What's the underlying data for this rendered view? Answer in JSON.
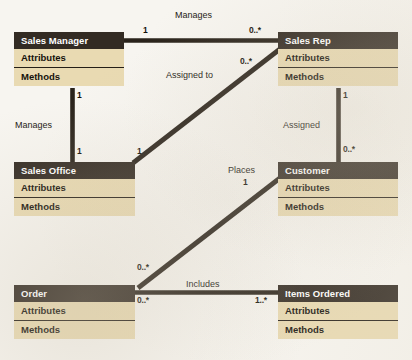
{
  "diagram": {
    "type": "uml-class-diagram",
    "colors": {
      "header_fill": "#332b23",
      "body_fill": "#e9dab2",
      "line": "#2a231b",
      "background": "#f7f5f0",
      "header_text": "#ffffff",
      "body_text": "#15120d"
    },
    "section_labels": {
      "attributes": "Attributes",
      "methods": "Methods"
    },
    "classes": [
      {
        "id": "sales-manager",
        "name": "Sales Manager",
        "attributes": "Attributes",
        "methods": "Methods",
        "x": 14,
        "y": 32,
        "w": 110
      },
      {
        "id": "sales-rep",
        "name": "Sales Rep",
        "attributes": "Attributes",
        "methods": "Methods",
        "x": 278,
        "y": 32,
        "w": 120
      },
      {
        "id": "sales-office",
        "name": "Sales Office",
        "attributes": "Attributes",
        "methods": "Methods",
        "x": 14,
        "y": 162,
        "w": 121
      },
      {
        "id": "customer",
        "name": "Customer",
        "attributes": "Attributes",
        "methods": "Methods",
        "x": 278,
        "y": 162,
        "w": 120
      },
      {
        "id": "order",
        "name": "Order",
        "attributes": "Attributes",
        "methods": "Methods",
        "x": 14,
        "y": 285,
        "w": 121
      },
      {
        "id": "items-ordered",
        "name": "Items Ordered",
        "attributes": "Attributes",
        "methods": "Methods",
        "x": 278,
        "y": 285,
        "w": 120
      }
    ],
    "associations": [
      {
        "id": "manages-rep",
        "label": "Manages",
        "from": "sales-manager",
        "to": "sales-rep",
        "from_multiplicity": "1",
        "to_multiplicity": "0..*"
      },
      {
        "id": "assigned-to",
        "label": "Assigned to",
        "from": "sales-office",
        "to": "sales-rep",
        "from_multiplicity": "1",
        "to_multiplicity": "0..*"
      },
      {
        "id": "manages-office",
        "label": "Manages",
        "from": "sales-manager",
        "to": "sales-office",
        "from_multiplicity": "1",
        "to_multiplicity": "1"
      },
      {
        "id": "assigned",
        "label": "Assigned",
        "from": "sales-rep",
        "to": "customer",
        "from_multiplicity": "1",
        "to_multiplicity": "0..*"
      },
      {
        "id": "places",
        "label": "Places",
        "from": "customer",
        "to": "order",
        "from_multiplicity": "1",
        "to_multiplicity": "0..*"
      },
      {
        "id": "includes",
        "label": "Includes",
        "from": "order",
        "to": "items-ordered",
        "from_multiplicity": "0..*",
        "to_multiplicity": "1..*"
      }
    ],
    "labels": {
      "manages_top": "Manages",
      "manages_left": "Manages",
      "assigned_to": "Assigned to",
      "assigned": "Assigned",
      "places": "Places",
      "includes": "Includes"
    },
    "multiplicities": {
      "manager_to_rep_left": "1",
      "manager_to_rep_right": "0..*",
      "office_to_rep_top": "0..*",
      "office_to_rep_bottom": "1",
      "manager_to_office_top": "1",
      "manager_to_office_bottom": "1",
      "rep_to_customer_top": "1",
      "rep_to_customer_bottom": "0..*",
      "customer_to_order_top": "1",
      "customer_to_order_bottom": "0..*",
      "order_to_items_left": "0..*",
      "order_to_items_right": "1..*"
    }
  }
}
